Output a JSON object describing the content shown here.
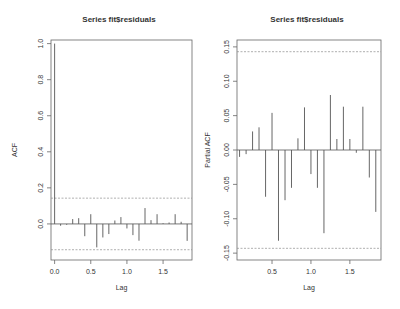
{
  "chart_data": [
    {
      "type": "bar",
      "subtype": "acf-stem",
      "title": "Series  fit$residuals",
      "xlabel": "Lag",
      "ylabel": "ACF",
      "xlim": [
        -0.05,
        1.9
      ],
      "ylim": [
        -0.2,
        1.02
      ],
      "xticks": [
        0.0,
        0.5,
        1.0,
        1.5
      ],
      "xtick_labels": [
        "0.0",
        "0.5",
        "1.0",
        "1.5"
      ],
      "yticks": [
        0.0,
        0.2,
        0.4,
        0.6,
        0.8,
        1.0
      ],
      "ytick_labels": [
        "0.0",
        "0.2",
        "0.4",
        "0.6",
        "0.8",
        "1.0"
      ],
      "confidence_bounds": [
        0.143,
        -0.143
      ],
      "grid": false,
      "x": [
        0.0,
        0.083,
        0.167,
        0.25,
        0.333,
        0.417,
        0.5,
        0.583,
        0.667,
        0.75,
        0.833,
        0.917,
        1.0,
        1.083,
        1.167,
        1.25,
        1.333,
        1.417,
        1.5,
        1.583,
        1.667,
        1.75,
        1.833
      ],
      "values": [
        1.0,
        -0.01,
        -0.005,
        0.027,
        0.032,
        -0.068,
        0.054,
        -0.13,
        -0.075,
        -0.056,
        0.019,
        0.038,
        -0.025,
        -0.062,
        -0.093,
        0.088,
        0.021,
        0.054,
        0.004,
        0.008,
        0.054,
        0.012,
        -0.094
      ]
    },
    {
      "type": "bar",
      "subtype": "pacf-stem",
      "title": "Series  fit$residuals",
      "xlabel": "Lag",
      "ylabel": "Partial ACF",
      "xlim": [
        0.05,
        1.9
      ],
      "ylim": [
        -0.16,
        0.16
      ],
      "xticks": [
        0.5,
        1.0,
        1.5
      ],
      "xtick_labels": [
        "0.5",
        "1.0",
        "1.5"
      ],
      "yticks": [
        -0.15,
        -0.1,
        -0.05,
        0.0,
        0.05,
        0.1,
        0.15
      ],
      "ytick_labels": [
        "-0.15",
        "-0.10",
        "-0.05",
        "0.00",
        "0.05",
        "0.10",
        "0.15"
      ],
      "confidence_bounds": [
        0.143,
        -0.143
      ],
      "grid": false,
      "x": [
        0.083,
        0.167,
        0.25,
        0.333,
        0.417,
        0.5,
        0.583,
        0.667,
        0.75,
        0.833,
        0.917,
        1.0,
        1.083,
        1.167,
        1.25,
        1.333,
        1.417,
        1.5,
        1.583,
        1.667,
        1.75,
        1.833
      ],
      "values": [
        -0.01,
        -0.006,
        0.027,
        0.033,
        -0.068,
        0.054,
        -0.132,
        -0.073,
        -0.055,
        0.017,
        0.062,
        -0.035,
        -0.055,
        -0.121,
        0.08,
        0.016,
        0.063,
        0.016,
        -0.004,
        0.063,
        -0.04,
        -0.09
      ]
    }
  ],
  "colors": {
    "stem": "#555555",
    "frame": "#666666",
    "ci": "#8c8c8c",
    "text": "#333333"
  }
}
